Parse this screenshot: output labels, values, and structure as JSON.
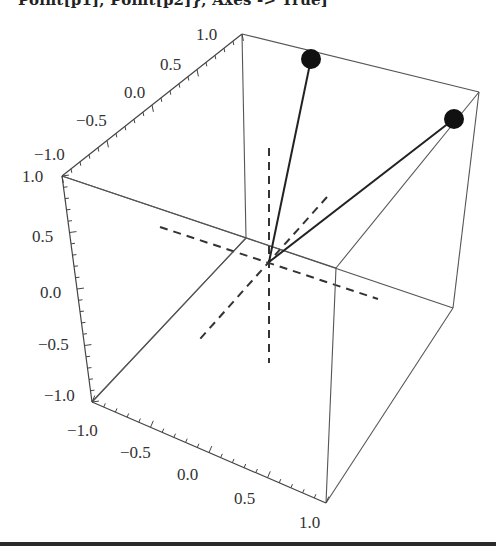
{
  "header": {
    "code_fragment": "Point[p1], Point[p2]}, Axes -> True]"
  },
  "chart_data": {
    "type": "scatter",
    "projection": "3d-box",
    "title": "",
    "axes": {
      "x": {
        "label": "",
        "range": [
          -1.0,
          1.0
        ],
        "ticks": [
          "-1.0",
          "-0.5",
          "0.0",
          "0.5",
          "1.0"
        ]
      },
      "y": {
        "label": "",
        "range": [
          -1.0,
          1.0
        ],
        "ticks": [
          "-1.0",
          "-0.5",
          "0.0",
          "0.5",
          "1.0"
        ]
      },
      "z": {
        "label": "",
        "range": [
          -1.0,
          1.0
        ],
        "ticks": [
          "-1.0",
          "-0.5",
          "0.0",
          "0.5",
          "1.0"
        ]
      }
    },
    "origin_axes": "dashed",
    "points": [
      {
        "name": "p1",
        "approx": [
          -0.5,
          1.0,
          1.0
        ]
      },
      {
        "name": "p2",
        "approx": [
          1.0,
          0.5,
          1.0
        ]
      }
    ],
    "vectors_from_origin": [
      "p1",
      "p2"
    ],
    "grid": false,
    "legend": null
  },
  "labels": {
    "top_axis": [
      "1.0",
      "0.5",
      "0.0",
      "−0.5",
      "−1.0"
    ],
    "left_axis": [
      "1.0",
      "0.5",
      "0.0",
      "−0.5",
      "−1.0"
    ],
    "bottom_axis": [
      "−1.0",
      "−0.5",
      "0.0",
      "0.5",
      "1.0"
    ]
  }
}
